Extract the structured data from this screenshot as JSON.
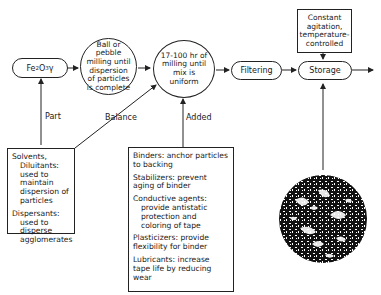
{
  "diagram": {
    "nodes": {
      "fe2o3": {
        "main": "Fe",
        "sub1": "2",
        "mid": "O",
        "sub2": "3",
        "tail": " γ"
      },
      "ball_milling": "Ball or pebble milling until dispersion of particles is complete",
      "long_milling": "17-100 hr of milling until mix is uniform",
      "filtering": "Filtering",
      "storage": "Storage",
      "storage_condition": "Constant agitation, temperature-controlled"
    },
    "edge_labels": {
      "part": "Part",
      "balance": "Balance",
      "added": "Added"
    },
    "solvents_box": [
      {
        "head": "Solvents,",
        "body": "Diluitants: used to maintain dispersion of particles"
      },
      {
        "head": "Dispersants:",
        "body": "used to disperse agglomerates"
      }
    ],
    "additives_box": [
      {
        "head": "Binders:",
        "body": "anchor particles to backing"
      },
      {
        "head": "Stabilizers:",
        "body": "prevent aging of binder"
      },
      {
        "head": "Conductive agents:",
        "body": "provide antistatic protection and coloring of tape"
      },
      {
        "head": "Plasticizers:",
        "body": "provide flexibility for binder"
      },
      {
        "head": "Lubricants:",
        "body": "increase tape life by reducing wear"
      }
    ],
    "image": "micrograph-of-dispersed-particles"
  }
}
